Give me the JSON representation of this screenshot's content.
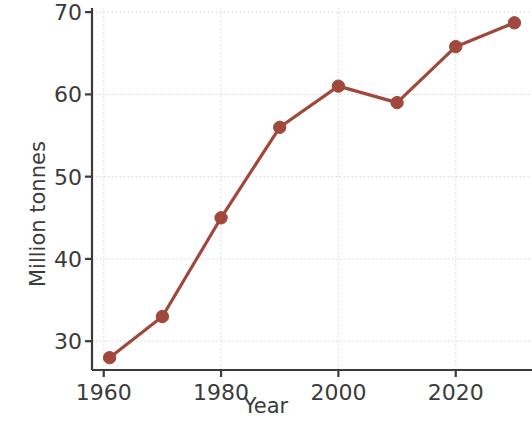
{
  "chart_data": {
    "type": "line",
    "title": "",
    "xlabel": "Year",
    "ylabel": "Million tonnes",
    "x": [
      1961,
      1970,
      1980,
      1990,
      2000,
      2010,
      2020,
      2030
    ],
    "values": [
      28,
      33,
      45,
      56,
      61,
      59,
      65.8,
      68.7
    ],
    "series": [
      {
        "name": "Million tonnes",
        "values": [
          28,
          33,
          45,
          56,
          61,
          59,
          65.8,
          68.7
        ]
      }
    ],
    "xlim": [
      1958,
      2033
    ],
    "ylim": [
      26.5,
      70.5
    ],
    "xticks": [
      1960,
      1980,
      2000,
      2020
    ],
    "xtick_labels": [
      "1960",
      "1980",
      "2000",
      "2020"
    ],
    "yticks": [
      30,
      40,
      50,
      60,
      70
    ],
    "ytick_labels": [
      "30",
      "40",
      "50",
      "60",
      "70"
    ],
    "grid": true,
    "grid_style": "dotted",
    "legend": false,
    "legend_position": "none",
    "marker": "circle",
    "line_color": "#A0483C",
    "marker_color": "#A0483C",
    "grid_color": "#e4e0e0",
    "axis_color": "#3b3b3b",
    "text_color": "#3b3b3b",
    "background": "#ffffff",
    "spines": [
      "left",
      "bottom"
    ]
  }
}
